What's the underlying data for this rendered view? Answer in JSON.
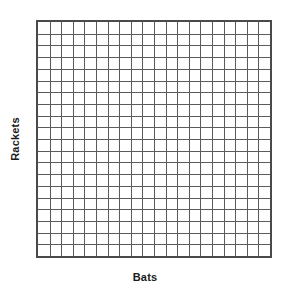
{
  "figure": {
    "width": 290,
    "height": 296,
    "background_color": "#ffffff"
  },
  "axes": {
    "x": {
      "label": "Bats",
      "tick_labels": [],
      "show_ticks": false
    },
    "y": {
      "label": "Rackets",
      "tick_labels": [],
      "show_ticks": false
    }
  },
  "plot": {
    "grid_color": "#5a5a5a",
    "border_color": "#4a4a4a",
    "plot_background": "#ffffff",
    "columns": 20,
    "rows": 20
  },
  "chart_data": {
    "type": "line",
    "title": "",
    "subtitle": "",
    "xlabel": "Bats",
    "ylabel": "Rackets",
    "series": [],
    "x": [],
    "categories": [],
    "values": [],
    "annotations": [],
    "legend": {
      "entries": [],
      "position": "none"
    },
    "grid": {
      "visible": true,
      "columns": 20,
      "rows": 20,
      "color": "#5a5a5a",
      "style": "solid"
    },
    "xlim": [
      0,
      20
    ],
    "ylim": [
      0,
      20
    ],
    "xticklabels": [],
    "yticklabels": [],
    "note": "Empty grid — blank axes with no plotted data"
  }
}
